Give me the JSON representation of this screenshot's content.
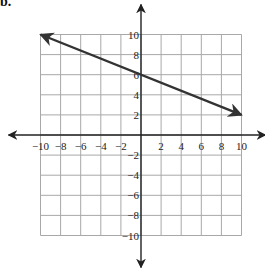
{
  "corner_label": "b.",
  "chart_data": {
    "type": "line",
    "title": "",
    "xlabel": "",
    "ylabel": "",
    "xlim": [
      -10,
      10
    ],
    "ylim": [
      -10,
      10
    ],
    "grid": true,
    "grid_step": 2,
    "x_ticks": [
      -10,
      -8,
      -6,
      -4,
      -2,
      2,
      4,
      6,
      8,
      10
    ],
    "y_ticks": [
      -10,
      -8,
      -6,
      -4,
      -2,
      2,
      4,
      6,
      8,
      10
    ],
    "x_tick_labels": [
      "−10",
      "−8",
      "−6",
      "−4",
      "−2",
      "2",
      "4",
      "6",
      "8",
      "10"
    ],
    "y_tick_labels": [
      "−10",
      "−8",
      "−6",
      "−4",
      "−2",
      "2",
      "4",
      "6",
      "8",
      "10"
    ],
    "series": [
      {
        "name": "line",
        "x": [
          -10,
          10
        ],
        "y": [
          10,
          2
        ],
        "slope": -0.4,
        "y_intercept": 6,
        "arrows": "both",
        "color": "#333333"
      }
    ],
    "axis_arrows": true,
    "colors": {
      "grid": "#a8a8a8",
      "axis": "#222222",
      "line": "#333333"
    }
  }
}
